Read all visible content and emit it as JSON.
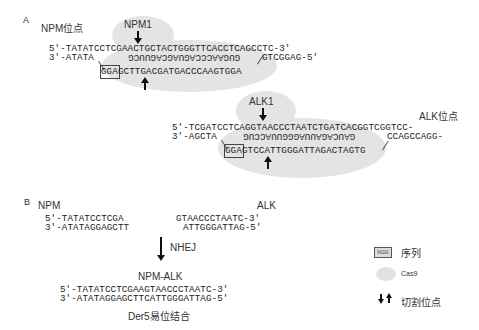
{
  "panel_a": {
    "panel_label": "A",
    "npm": {
      "locus_label": "NPM位点",
      "guide_label": "NPM1",
      "top_strand": "5′-TATATCCTCGAACTGCTACTGGGTTCACCTCAGCCTC-3′",
      "bottom_left": "3′-ATATA",
      "guide_rna_rotated": "GUGAACCCAGUAGCAGUUCG",
      "bottom_right": "GTCGGAG-5′",
      "pam": "GGA",
      "target_strand": "GCTTGACGATGACCCAAGTGGA"
    },
    "alk": {
      "locus_label": "ALK位点",
      "guide_label": "ALK1",
      "top_strand": "5′-TCGATCCTCAGGTAACCCTAATCTGATCACGGTCGGTCC-",
      "bottom_left": "3′-AGCTA",
      "guide_rna_rotated": "GAUCAGAUUAGGGUUACCUG",
      "bottom_right": "CCAGCCAGG-",
      "pam": "GGA",
      "target_strand": "GTCCATTGGGATTAGACTAGTG"
    }
  },
  "panel_b": {
    "panel_label": "B",
    "npm_label": "NPM",
    "alk_label": "ALK",
    "npm_top": "5′-TATATCCTCGA",
    "npm_bottom": "3′-ATATAGGAGCTT",
    "alk_top": "GTAACCCTAATC-3′",
    "alk_bottom": "ATTGGGATTAG-5′",
    "process_label": "NHEJ",
    "fusion_label": "NPM-ALK",
    "fusion_top": "5′-TATATCCTCGAAGTAACCCTAATC-3′",
    "fusion_bottom": "3′-ATATAGGAGCTTCATTGGGATTAG-5′",
    "caption": "Der5易位结合"
  },
  "legend": {
    "pam_box_text": "NGG",
    "pam_label": "序列",
    "cas9_label": "Cas9",
    "cut_label": "切割位点"
  },
  "colors": {
    "cas9_fill": "#e4e4e4",
    "text": "#222222"
  }
}
